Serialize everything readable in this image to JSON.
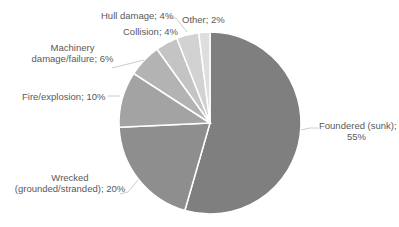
{
  "chart_data": {
    "type": "pie",
    "title": "",
    "start_angle_deg": 0,
    "direction": "clockwise",
    "slices": [
      {
        "label": "Foundered (sunk)",
        "value": 55,
        "color": "#7f7f7f",
        "display": "Foundered (sunk);",
        "display2": "55%"
      },
      {
        "label": "Wrecked (grounded/stranded)",
        "value": 20,
        "color": "#8e8e8e",
        "display": "Wrecked",
        "display2": "(grounded/stranded); 20%"
      },
      {
        "label": "Fire/explosion",
        "value": 10,
        "color": "#a3a3a3",
        "display": "Fire/explosion; 10%"
      },
      {
        "label": "Machinery damage/failure",
        "value": 6,
        "color": "#b3b3b3",
        "display": "Machinery",
        "display2": "damage/failure; 6%"
      },
      {
        "label": "Collision",
        "value": 4,
        "color": "#c4c4c4",
        "display": "Collision; 4%"
      },
      {
        "label": "Hull damage",
        "value": 4,
        "color": "#d2d2d2",
        "display": "Hull damage; 4%"
      },
      {
        "label": "Other",
        "value": 2,
        "color": "#dedede",
        "display": "Other; 2%"
      }
    ],
    "legend": "none",
    "data_labels": "category; percentage"
  }
}
